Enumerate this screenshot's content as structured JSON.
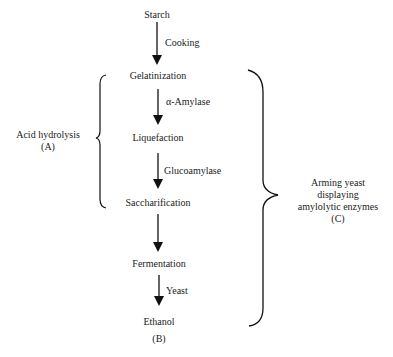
{
  "diagram": {
    "stages": [
      {
        "id": "starch",
        "label": "Starch"
      },
      {
        "id": "gelatinization",
        "label": "Gelatinization"
      },
      {
        "id": "liquefaction",
        "label": "Liquefaction"
      },
      {
        "id": "saccharification",
        "label": "Saccharification"
      },
      {
        "id": "fermentation",
        "label": "Fermentation"
      },
      {
        "id": "ethanol",
        "label": "Ethanol",
        "tag": "(B)"
      }
    ],
    "arrows": [
      {
        "from": "starch",
        "to": "gelatinization",
        "label": "Cooking"
      },
      {
        "from": "gelatinization",
        "to": "liquefaction",
        "label": "α-Amylase"
      },
      {
        "from": "liquefaction",
        "to": "saccharification",
        "label": "Glucoamylase"
      },
      {
        "from": "saccharification",
        "to": "fermentation",
        "label": ""
      },
      {
        "from": "fermentation",
        "to": "ethanol",
        "label": "Yeast"
      }
    ],
    "groups": [
      {
        "id": "A",
        "side": "left",
        "spans": [
          "gelatinization",
          "saccharification"
        ],
        "lines": [
          "Acid hydrolysis",
          "(A)"
        ]
      },
      {
        "id": "C",
        "side": "right",
        "spans": [
          "gelatinization",
          "ethanol"
        ],
        "lines": [
          "Arming yeast",
          "displaying",
          "amylolytic enzymes",
          "(C)"
        ]
      }
    ]
  }
}
